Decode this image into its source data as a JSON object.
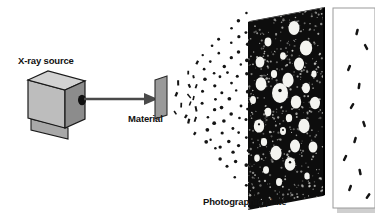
{
  "figure": {
    "kind": "x-ray-diffraction-schematic",
    "background_color": "#ffffff",
    "labels": {
      "source": "X-ray source",
      "material": "Material",
      "plate": "Photographic plate"
    },
    "colors": {
      "box_top": "#d2d2d2",
      "box_front": "#bdbdbd",
      "box_side": "#8c8c8c",
      "box_base": "#a8a8a8",
      "box_outline": "#1a1a1a",
      "aperture": "#101010",
      "beam": "#4a4a4a",
      "sample_fill": "#9a9a9a",
      "sample_outline": "#2a2a2a",
      "plate_fill": "#0d0d0d",
      "plate_edge": "#000000",
      "spot_fill": "#f4f4f0",
      "scatter_dot": "#141414",
      "panel_fill": "#ffffff",
      "panel_border": "#9a9a9a",
      "panel_shadow": "#cfcfcf",
      "text": "#111111"
    },
    "source_box": {
      "front": [
        [
          28,
          80
        ],
        [
          28,
          118
        ],
        [
          65,
          128
        ],
        [
          65,
          90
        ]
      ],
      "top": [
        [
          28,
          80
        ],
        [
          48,
          71
        ],
        [
          85,
          81
        ],
        [
          65,
          90
        ]
      ],
      "side": [
        [
          65,
          90
        ],
        [
          85,
          81
        ],
        [
          85,
          119
        ],
        [
          65,
          128
        ]
      ],
      "base": [
        [
          31,
          119
        ],
        [
          31,
          130
        ],
        [
          68,
          139
        ],
        [
          68,
          128
        ]
      ],
      "aperture_cx": 82,
      "aperture_cy": 100,
      "aperture_rx": 4.0,
      "aperture_ry": 5.2
    },
    "beam": {
      "x1": 84,
      "y1": 99,
      "x2": 153,
      "y2": 99,
      "width": 2.6,
      "arrow": [
        [
          144,
          93
        ],
        [
          158,
          99
        ],
        [
          144,
          105
        ]
      ]
    },
    "sample": {
      "shape": [
        [
          155,
          80
        ],
        [
          167,
          76
        ],
        [
          167,
          115
        ],
        [
          155,
          119
        ]
      ]
    },
    "plate": {
      "face": [
        [
          248,
          22
        ],
        [
          323,
          8
        ],
        [
          323,
          196
        ],
        [
          248,
          210
        ]
      ],
      "edge": [
        [
          248,
          22
        ],
        [
          250,
          21
        ],
        [
          325,
          7
        ],
        [
          323,
          8
        ]
      ],
      "side": [
        [
          323,
          8
        ],
        [
          325,
          7
        ],
        [
          325,
          195
        ],
        [
          323,
          196
        ]
      ]
    },
    "plate_spots": [
      {
        "cx": 294,
        "cy": 28,
        "rx": 5.5,
        "ry": 7.0
      },
      {
        "cx": 268,
        "cy": 42,
        "rx": 3.4,
        "ry": 4.4
      },
      {
        "cx": 306,
        "cy": 48,
        "rx": 6.2,
        "ry": 7.6
      },
      {
        "cx": 283,
        "cy": 56,
        "rx": 2.9,
        "ry": 3.8
      },
      {
        "cx": 260,
        "cy": 62,
        "rx": 4.4,
        "ry": 5.6
      },
      {
        "cx": 299,
        "cy": 64,
        "rx": 5.0,
        "ry": 6.4
      },
      {
        "cx": 274,
        "cy": 74,
        "rx": 3.1,
        "ry": 4.0
      },
      {
        "cx": 314,
        "cy": 74,
        "rx": 2.6,
        "ry": 3.4
      },
      {
        "cx": 288,
        "cy": 80,
        "rx": 5.6,
        "ry": 7.2
      },
      {
        "cx": 261,
        "cy": 84,
        "rx": 5.4,
        "ry": 6.8
      },
      {
        "cx": 306,
        "cy": 88,
        "rx": 4.0,
        "ry": 5.2
      },
      {
        "cx": 280,
        "cy": 93,
        "rx": 8.0,
        "ry": 10.0,
        "center_dot": true
      },
      {
        "cx": 253,
        "cy": 100,
        "rx": 3.0,
        "ry": 3.9
      },
      {
        "cx": 296,
        "cy": 102,
        "rx": 5.2,
        "ry": 6.6
      },
      {
        "cx": 315,
        "cy": 103,
        "rx": 5.0,
        "ry": 6.2
      },
      {
        "cx": 268,
        "cy": 112,
        "rx": 3.3,
        "ry": 4.2
      },
      {
        "cx": 289,
        "cy": 118,
        "rx": 3.2,
        "ry": 4.1
      },
      {
        "cx": 259,
        "cy": 126,
        "rx": 5.2,
        "ry": 6.6,
        "center_dot": true
      },
      {
        "cx": 304,
        "cy": 126,
        "rx": 5.6,
        "ry": 7.2
      },
      {
        "cx": 283,
        "cy": 131,
        "rx": 3.0,
        "ry": 3.9,
        "center_dot": true
      },
      {
        "cx": 264,
        "cy": 142,
        "rx": 3.1,
        "ry": 4.0
      },
      {
        "cx": 295,
        "cy": 146,
        "rx": 5.0,
        "ry": 6.4
      },
      {
        "cx": 313,
        "cy": 147,
        "rx": 4.4,
        "ry": 5.6
      },
      {
        "cx": 276,
        "cy": 153,
        "rx": 5.6,
        "ry": 7.2
      },
      {
        "cx": 257,
        "cy": 158,
        "rx": 2.8,
        "ry": 3.6
      },
      {
        "cx": 290,
        "cy": 164,
        "rx": 5.4,
        "ry": 6.8,
        "center_dot": true
      },
      {
        "cx": 266,
        "cy": 170,
        "rx": 3.0,
        "ry": 3.8
      },
      {
        "cx": 307,
        "cy": 176,
        "rx": 2.7,
        "ry": 3.5
      },
      {
        "cx": 279,
        "cy": 182,
        "rx": 3.0,
        "ry": 3.9
      }
    ],
    "scatter_cone": {
      "apex_x": 168,
      "apex_y": 99,
      "rings": 9,
      "dots_per_ring": [
        4,
        6,
        7,
        8,
        9,
        10,
        11,
        12,
        12
      ],
      "reach_x": 246,
      "half_spread": 84
    },
    "side_panel": {
      "x": 333,
      "y": 8,
      "width": 42,
      "height": 200,
      "marks": [
        {
          "x": 357,
          "y": 32,
          "r": 14
        },
        {
          "x": 366,
          "y": 47,
          "r": -28
        },
        {
          "x": 349,
          "y": 68,
          "r": 22
        },
        {
          "x": 359,
          "y": 86,
          "r": 8
        },
        {
          "x": 352,
          "y": 106,
          "r": 30
        },
        {
          "x": 364,
          "y": 124,
          "r": -18
        },
        {
          "x": 355,
          "y": 140,
          "r": 16
        },
        {
          "x": 345,
          "y": 158,
          "r": 26
        },
        {
          "x": 360,
          "y": 172,
          "r": -12
        },
        {
          "x": 350,
          "y": 188,
          "r": 20
        },
        {
          "x": 368,
          "y": 196,
          "r": 34
        }
      ]
    },
    "label_positions": {
      "source": {
        "x": 18,
        "y": 64
      },
      "material": {
        "x": 128,
        "y": 122
      },
      "plate": {
        "x": 203,
        "y": 205
      }
    }
  }
}
